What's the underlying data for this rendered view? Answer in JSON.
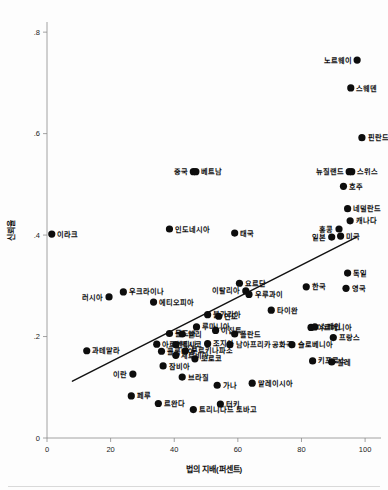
{
  "chart_data": {
    "type": "scatter",
    "title": "",
    "xlabel": "법의 지배(퍼센트)",
    "ylabel": "신뢰율",
    "xlim": [
      0,
      105
    ],
    "ylim": [
      0,
      0.82
    ],
    "xticks": [
      "0",
      "20",
      "40",
      "60",
      "80",
      "100"
    ],
    "xtick_values": [
      0,
      20,
      40,
      60,
      80,
      100
    ],
    "yticks": [
      "0",
      ".2",
      ".4",
      ".6",
      ".8"
    ],
    "ytick_values": [
      0,
      0.2,
      0.4,
      0.6,
      0.8
    ],
    "grid": false,
    "legend": false,
    "marker_color": "#0d0d0d",
    "trendline": {
      "label": "선형 적합선",
      "color": "#111111",
      "x_start": 8,
      "y_start": 0.112,
      "x_end": 97,
      "y_end": 0.395
    },
    "points": [
      {
        "label": "노르웨이",
        "x": 97.5,
        "y": 0.745,
        "label_side": "left"
      },
      {
        "label": "스웨덴",
        "x": 95.5,
        "y": 0.69,
        "label_side": "right"
      },
      {
        "label": "핀란드",
        "x": 99.0,
        "y": 0.592,
        "label_side": "right"
      },
      {
        "label": "중국",
        "x": 46.0,
        "y": 0.525,
        "label_side": "left"
      },
      {
        "label": "베트남",
        "x": 46.8,
        "y": 0.525,
        "label_side": "right"
      },
      {
        "label": "뉴질랜드",
        "x": 95.0,
        "y": 0.525,
        "label_side": "left"
      },
      {
        "label": "스위스",
        "x": 95.8,
        "y": 0.525,
        "label_side": "right"
      },
      {
        "label": "호주",
        "x": 93.2,
        "y": 0.496,
        "label_side": "right"
      },
      {
        "label": "네덜란드",
        "x": 94.5,
        "y": 0.452,
        "label_side": "right"
      },
      {
        "label": "캐나다",
        "x": 95.3,
        "y": 0.428,
        "label_side": "right"
      },
      {
        "label": "홍콩",
        "x": 91.8,
        "y": 0.412,
        "label_side": "left"
      },
      {
        "label": "일본",
        "x": 89.5,
        "y": 0.396,
        "label_side": "left"
      },
      {
        "label": "미국",
        "x": 92.3,
        "y": 0.398,
        "label_side": "right"
      },
      {
        "label": "인도네시아",
        "x": 38.5,
        "y": 0.412,
        "label_side": "right"
      },
      {
        "label": "태국",
        "x": 59.0,
        "y": 0.404,
        "label_side": "right"
      },
      {
        "label": "이라크",
        "x": 1.5,
        "y": 0.402,
        "label_side": "right"
      },
      {
        "label": "독일",
        "x": 94.5,
        "y": 0.325,
        "label_side": "right"
      },
      {
        "label": "요르단",
        "x": 60.5,
        "y": 0.305,
        "label_side": "right"
      },
      {
        "label": "한국",
        "x": 81.5,
        "y": 0.298,
        "label_side": "right"
      },
      {
        "label": "영국",
        "x": 94.0,
        "y": 0.295,
        "label_side": "right"
      },
      {
        "label": "이탈리아",
        "x": 62.5,
        "y": 0.29,
        "label_side": "left"
      },
      {
        "label": "우크라이나",
        "x": 24.0,
        "y": 0.288,
        "label_side": "right"
      },
      {
        "label": "러시아",
        "x": 19.5,
        "y": 0.278,
        "label_side": "left"
      },
      {
        "label": "우루과이",
        "x": 63.5,
        "y": 0.283,
        "label_side": "right"
      },
      {
        "label": "에티오피아",
        "x": 33.5,
        "y": 0.268,
        "label_side": "right"
      },
      {
        "label": "타이완",
        "x": 70.5,
        "y": 0.252,
        "label_side": "right"
      },
      {
        "label": "불가리아",
        "x": 50.5,
        "y": 0.243,
        "label_side": "right"
      },
      {
        "label": "인도",
        "x": 54.0,
        "y": 0.24,
        "label_side": "right"
      },
      {
        "label": "루마니아",
        "x": 47.0,
        "y": 0.219,
        "label_side": "right"
      },
      {
        "label": "아르메니아",
        "x": 83.0,
        "y": 0.218,
        "label_side": "right"
      },
      {
        "label": "스페인",
        "x": 84.2,
        "y": 0.219,
        "label_side": "right"
      },
      {
        "label": "이집트",
        "x": 53.0,
        "y": 0.212,
        "label_side": "right"
      },
      {
        "label": "몰도바",
        "x": 38.5,
        "y": 0.206,
        "label_side": "right"
      },
      {
        "label": "말리",
        "x": 42.5,
        "y": 0.205,
        "label_side": "right"
      },
      {
        "label": "폴란드",
        "x": 59.0,
        "y": 0.205,
        "label_side": "right"
      },
      {
        "label": "프랑스",
        "x": 90.0,
        "y": 0.198,
        "label_side": "right"
      },
      {
        "label": "아르헨티나",
        "x": 34.5,
        "y": 0.185,
        "label_side": "right"
      },
      {
        "label": "멕시코",
        "x": 40.5,
        "y": 0.184,
        "label_side": "right"
      },
      {
        "label": "조지아",
        "x": 50.5,
        "y": 0.186,
        "label_side": "right"
      },
      {
        "label": "남아프리카 공화국",
        "x": 57.5,
        "y": 0.184,
        "label_side": "right"
      },
      {
        "label": "슬로베니아",
        "x": 77.0,
        "y": 0.184,
        "label_side": "right"
      },
      {
        "label": "과테말라",
        "x": 12.5,
        "y": 0.172,
        "label_side": "right"
      },
      {
        "label": "콜롬비아",
        "x": 36.0,
        "y": 0.171,
        "label_side": "right"
      },
      {
        "label": "부르키나파소",
        "x": 43.5,
        "y": 0.172,
        "label_side": "right"
      },
      {
        "label": "세르비아",
        "x": 40.5,
        "y": 0.163,
        "label_side": "right"
      },
      {
        "label": "모로코",
        "x": 46.5,
        "y": 0.156,
        "label_side": "right"
      },
      {
        "label": "키프로스",
        "x": 83.5,
        "y": 0.152,
        "label_side": "right"
      },
      {
        "label": "칠레",
        "x": 89.5,
        "y": 0.15,
        "label_side": "right"
      },
      {
        "label": "잠비아",
        "x": 36.5,
        "y": 0.142,
        "label_side": "right"
      },
      {
        "label": "이란",
        "x": 27.0,
        "y": 0.126,
        "label_side": "left"
      },
      {
        "label": "브라질",
        "x": 42.5,
        "y": 0.12,
        "label_side": "right"
      },
      {
        "label": "가나",
        "x": 53.5,
        "y": 0.104,
        "label_side": "right"
      },
      {
        "label": "말레이시아",
        "x": 64.5,
        "y": 0.108,
        "label_side": "right"
      },
      {
        "label": "페루",
        "x": 26.5,
        "y": 0.083,
        "label_side": "right"
      },
      {
        "label": "르완다",
        "x": 35.0,
        "y": 0.068,
        "label_side": "right"
      },
      {
        "label": "터키",
        "x": 54.5,
        "y": 0.067,
        "label_side": "right"
      },
      {
        "label": "트리니다드 토바고",
        "x": 46.0,
        "y": 0.056,
        "label_side": "right"
      }
    ]
  }
}
